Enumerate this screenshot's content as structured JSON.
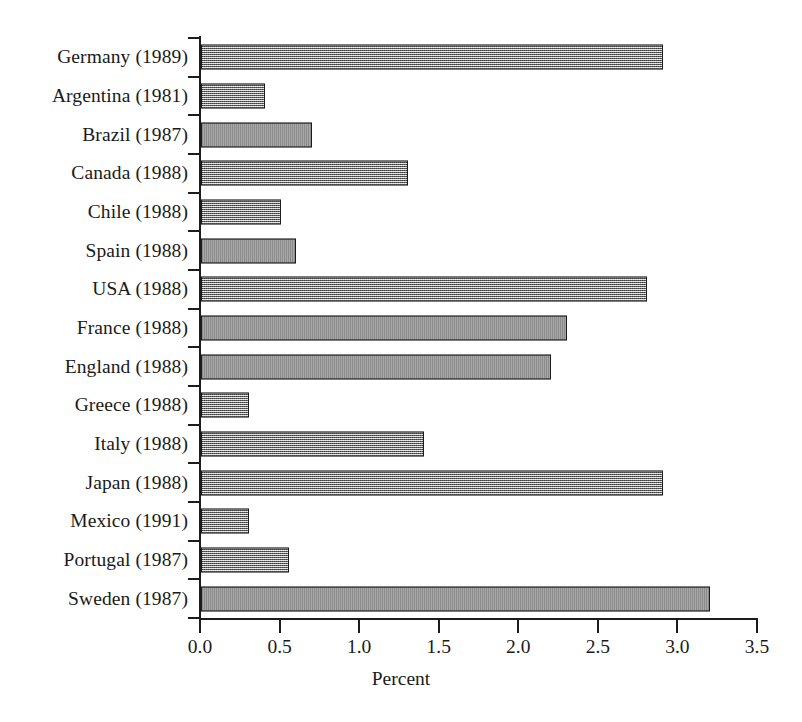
{
  "chart_data": {
    "type": "bar",
    "orientation": "horizontal",
    "title": "",
    "xlabel": "Percent",
    "ylabel": "",
    "xlim": [
      0.0,
      3.5
    ],
    "xticks": [
      "0.0",
      "0.5",
      "1.0",
      "1.5",
      "2.0",
      "2.5",
      "3.0",
      "3.5"
    ],
    "xtick_values": [
      0.0,
      0.5,
      1.0,
      1.5,
      2.0,
      2.5,
      3.0,
      3.5
    ],
    "grid": false,
    "legend": false,
    "categories": [
      "Germany (1989)",
      "Argentina (1981)",
      "Brazil (1987)",
      "Canada (1988)",
      "Chile (1988)",
      "Spain (1988)",
      "USA (1988)",
      "France (1988)",
      "England (1988)",
      "Greece (1988)",
      "Italy (1988)",
      "Japan (1988)",
      "Mexico (1991)",
      "Portugal (1987)",
      "Sweden (1987)"
    ],
    "values": [
      2.9,
      0.4,
      0.7,
      1.3,
      0.5,
      0.6,
      2.8,
      2.3,
      2.2,
      0.3,
      1.4,
      2.9,
      0.3,
      0.55,
      3.2
    ],
    "bar_fill_color": "#b9b9b9",
    "bar_edge_color": "#1c1c1c",
    "axis_color": "#1c1c1c",
    "background_color": "#ffffff"
  }
}
